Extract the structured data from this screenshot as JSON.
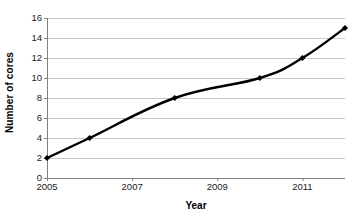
{
  "chart_data": {
    "type": "line",
    "title": "",
    "xlabel": "Year",
    "ylabel": "Number of cores",
    "x": [
      2005,
      2006,
      2008,
      2010,
      2011,
      2012
    ],
    "values": [
      2,
      4,
      8,
      10,
      12,
      15
    ],
    "series": [
      {
        "name": "Number of cores",
        "values": [
          2,
          4,
          8,
          10,
          12,
          15
        ]
      }
    ],
    "xlim": [
      2005,
      2012
    ],
    "ylim": [
      0,
      16
    ],
    "x_ticks": [
      2005,
      2007,
      2009,
      2011
    ],
    "x_tick_labels": [
      "2005",
      "2007",
      "2009",
      "2011"
    ],
    "y_ticks": [
      0,
      2,
      4,
      6,
      8,
      10,
      12,
      14,
      16
    ],
    "y_tick_labels": [
      "0",
      "2",
      "4",
      "6",
      "8",
      "10",
      "12",
      "14",
      "16"
    ],
    "grid": "horizontal",
    "legend": "none",
    "line_color": "#000000",
    "marker": "diamond",
    "marker_color": "#000000",
    "grid_color": "#c8c8c8",
    "axis_color": "#808080",
    "background": "#ffffff"
  }
}
